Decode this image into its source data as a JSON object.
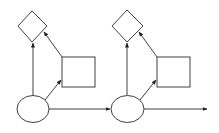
{
  "diagram": {
    "type": "flow-diagram",
    "colors": {
      "background": "#ffffff",
      "stroke": "#404040",
      "fill": "#ffffff"
    },
    "stages": [
      {
        "id": "stage-1",
        "ellipse": {
          "cx": 33,
          "cy": 109,
          "rx": 16,
          "ry": 13.5
        },
        "diamond": {
          "points": "32,11 47,26 32,42 18,26"
        },
        "square": {
          "x": 62,
          "y": 57,
          "width": 33,
          "height": 30
        }
      },
      {
        "id": "stage-2",
        "ellipse": {
          "cx": 127.5,
          "cy": 109,
          "rx": 16.5,
          "ry": 13.5
        },
        "diamond": {
          "points": "127,10 143,26 127,42 112,26"
        },
        "square": {
          "x": 157,
          "y": 57,
          "width": 33,
          "height": 30
        }
      }
    ],
    "edges": [
      {
        "from": "ellipse-1",
        "to": "diamond-1",
        "x1": 33,
        "y1": 95.5,
        "x2": 33,
        "y2": 43
      },
      {
        "from": "ellipse-1",
        "to": "square-1",
        "x1": 45,
        "y1": 100,
        "x2": 61,
        "y2": 80
      },
      {
        "from": "square-1",
        "to": "diamond-1",
        "x1": 62,
        "y1": 57,
        "x2": 44,
        "y2": 32
      },
      {
        "from": "ellipse-1",
        "to": "ellipse-2",
        "x1": 49,
        "y1": 109,
        "x2": 110,
        "y2": 109
      },
      {
        "from": "ellipse-2",
        "to": "diamond-2",
        "x1": 127,
        "y1": 95.5,
        "x2": 127,
        "y2": 43
      },
      {
        "from": "ellipse-2",
        "to": "square-2",
        "x1": 140,
        "y1": 100,
        "x2": 156,
        "y2": 80
      },
      {
        "from": "square-2",
        "to": "diamond-2",
        "x1": 157,
        "y1": 57,
        "x2": 139,
        "y2": 32
      },
      {
        "from": "ellipse-2",
        "to": "out",
        "x1": 144,
        "y1": 109,
        "x2": 207,
        "y2": 109
      }
    ]
  }
}
